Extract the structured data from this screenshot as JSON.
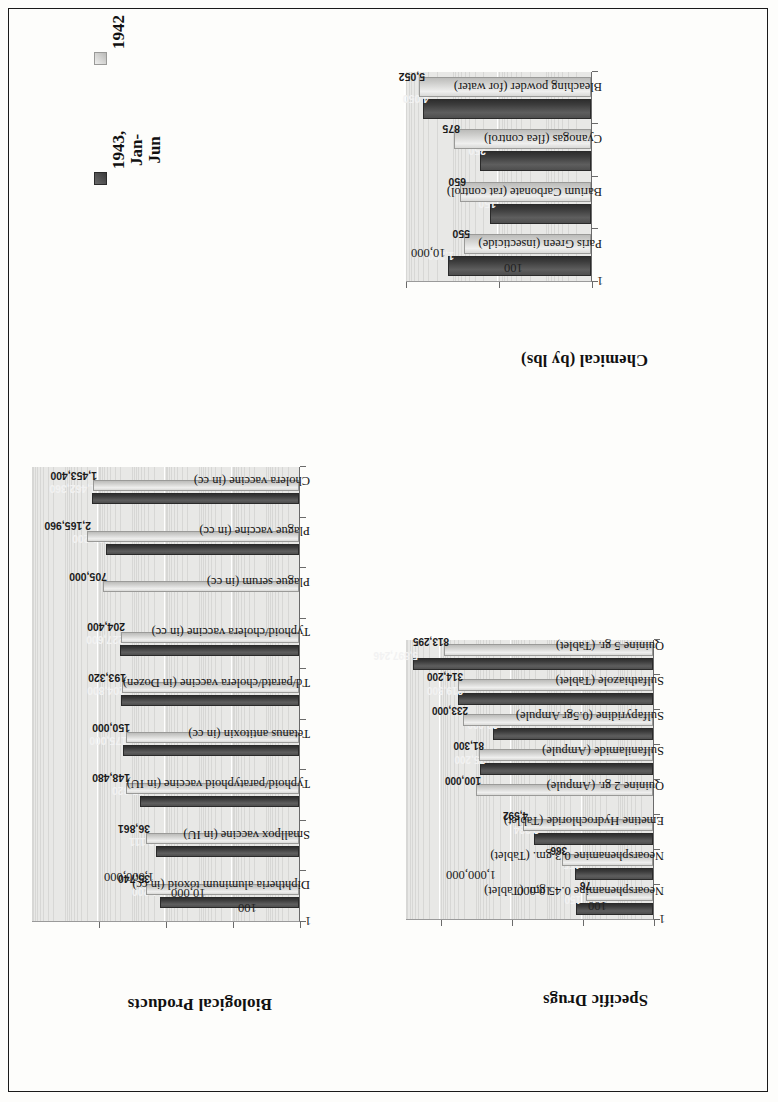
{
  "page": {
    "legend": {
      "series": [
        {
          "key": "s1943",
          "label": "1943,\nJan-\nJun",
          "color": "#3c3c3c"
        },
        {
          "key": "s1942",
          "label": "1942",
          "color": "#c9c9c7"
        }
      ]
    }
  },
  "chart_data": [
    {
      "id": "biological-products",
      "type": "bar",
      "title": "Biological Products",
      "orientation": "rotated-90",
      "scale": "log",
      "ylim": [
        1,
        100000000
      ],
      "ytick_labels": [
        "1",
        "100",
        "10,000",
        "1,000,000"
      ],
      "ytick_values": [
        1,
        100,
        10000,
        1000000
      ],
      "grid": true,
      "legend_position": "top",
      "xlabel": "",
      "ylabel": "",
      "categories": [
        "Diphtheria aluminum toxoid (in cc)",
        "Smallpox vaccine (in IU)",
        "Typhoid/paratyphoid vaccine (in IU)",
        "Tetanus antitoxin (in cc)",
        "Td/paratd/cholera vaccine (in Dozen)",
        "Typhoid/cholera vaccine (in cc)",
        "Plague serum (in cc)",
        "Plague vaccine (in cc)",
        "Cholera vaccine (in cc)"
      ],
      "series": [
        {
          "name": "1943, Jan-Jun",
          "values": [
            14200,
            18111,
            57320,
            175000,
            204800,
            227600,
            null,
            566200,
            1462360
          ],
          "labels": [
            "14,200",
            "18,111",
            "57,320",
            "175,000",
            "204,800",
            "227,600",
            "",
            "566,200",
            "1,462,360"
          ]
        },
        {
          "name": "1942",
          "values": [
            35740,
            36861,
            148480,
            150000,
            193320,
            204400,
            705000,
            2165960,
            1453400
          ],
          "labels": [
            "35,740",
            "36,861",
            "148,480",
            "150,000",
            "193,320",
            "204,400",
            "705,000",
            "2,165,960",
            "1,453,400"
          ]
        }
      ]
    },
    {
      "id": "chemical-by-lbs",
      "type": "bar",
      "title": "Chemical (by lbs)",
      "orientation": "rotated-90",
      "scale": "log",
      "ylim": [
        1,
        10000
      ],
      "ytick_labels": [
        "1",
        "100",
        "10,000"
      ],
      "ytick_values": [
        1,
        100,
        10000
      ],
      "grid": true,
      "legend_position": "none",
      "xlabel": "",
      "ylabel": "",
      "categories": [
        "Paris Green (insecticide)",
        "Barium Carbonate (rat control)",
        "Cyanogas (flea control)",
        "Bleaching powder (for water)"
      ],
      "series": [
        {
          "name": "1943, Jan-Jun",
          "values": [
            1200,
            150,
            250,
            4050
          ],
          "labels": [
            "1,200",
            "150",
            "250",
            "4,050"
          ]
        },
        {
          "name": "1942",
          "values": [
            550,
            650,
            875,
            5052
          ],
          "labels": [
            "550",
            "650",
            "875",
            "5,052"
          ]
        }
      ]
    },
    {
      "id": "specific-drugs",
      "type": "bar",
      "title": "Specific Drugs",
      "orientation": "rotated-90",
      "scale": "log",
      "ylim": [
        1,
        10000000
      ],
      "ytick_labels": [
        "1",
        "100",
        "10,000",
        "1,000,000"
      ],
      "ytick_values": [
        1,
        100,
        10000,
        1000000
      ],
      "grid": true,
      "legend_position": "none",
      "xlabel": "",
      "ylabel": "",
      "categories": [
        "Neoarsphenamine 0.45 gm. (Tablet)",
        "Neoarsphenamine 0.3 gm. (Tablet)",
        "Emetine Hydrochloride (Tablet)",
        "Quinine 2 gr. (Ampule)",
        "Sulfanilamide (Ampule)",
        "Sulfapyridine  (0.5gr Ampule)",
        "Sulfathiazole  (Tablet)",
        "Quinine 5 gr. (Tablet)"
      ],
      "series": [
        {
          "name": "1943, Jan-Jun",
          "values": [
            150,
            155,
            2234,
            null,
            75200,
            32000,
            319500,
            5897246
          ],
          "labels": [
            "150",
            "155",
            "2,234",
            "",
            "75,200",
            "32,000",
            "319,500",
            "5,897,246"
          ]
        },
        {
          "name": "1942",
          "values": [
            76,
            366,
            4592,
            100000,
            81300,
            233000,
            314200,
            813295
          ],
          "labels": [
            "76",
            "366",
            "4,592",
            "100,000",
            "81,300",
            "233,000",
            "314,200",
            "813,295"
          ]
        }
      ]
    }
  ]
}
